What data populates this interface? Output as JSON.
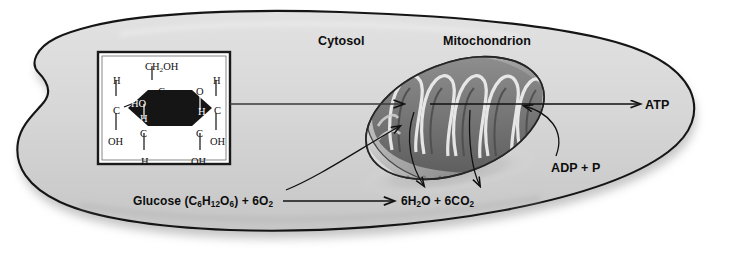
{
  "diagram": {
    "type": "biological-cell-diagram",
    "background_color": "#ffffff",
    "cytoplasm_color": "#d8d8d8",
    "outline_color": "#111111",
    "mitochondrion_color": "#9a9a9a"
  },
  "labels": {
    "cytosol": "Cytosol",
    "mitochondrion": "Mitochondrion",
    "atp": "ATP",
    "adp": "ADP + P"
  },
  "equation": {
    "reactants_prefix": "Glucose (C",
    "reactants_full": "Glucose (C6H12O6) + 6O2",
    "products_full": "6H2O + 6CO2",
    "reactants_parts": [
      {
        "text": "Glucose (C",
        "sub": false
      },
      {
        "text": "6",
        "sub": true
      },
      {
        "text": "H",
        "sub": false
      },
      {
        "text": "12",
        "sub": true
      },
      {
        "text": "O",
        "sub": false
      },
      {
        "text": "6",
        "sub": true
      },
      {
        "text": ") + 6O",
        "sub": false
      },
      {
        "text": "2",
        "sub": true
      }
    ],
    "products_parts": [
      {
        "text": "6H",
        "sub": false
      },
      {
        "text": "2",
        "sub": true
      },
      {
        "text": "O + 6CO",
        "sub": false
      },
      {
        "text": "2",
        "sub": true
      }
    ]
  },
  "glucose_inset": {
    "box_border_color": "#1a1a1a",
    "box_fill": "#ffffff",
    "ring_fill": "#151515",
    "atoms": [
      {
        "id": "ch2oh-top",
        "text": "CH2OH",
        "x": 145,
        "y": 61,
        "color": "dark"
      },
      {
        "id": "c-top-left",
        "text": "C",
        "x": 158,
        "y": 86,
        "color": "dark"
      },
      {
        "id": "h-upper-left",
        "text": "H",
        "x": 113,
        "y": 75,
        "color": "dark"
      },
      {
        "id": "c-left",
        "text": "C",
        "x": 113,
        "y": 105,
        "color": "dark"
      },
      {
        "id": "oh-lower-left",
        "text": "OH",
        "x": 108,
        "y": 136,
        "color": "dark"
      },
      {
        "id": "ho-inner",
        "text": "HO",
        "x": 131,
        "y": 98,
        "color": "white"
      },
      {
        "id": "h-inner",
        "text": "H",
        "x": 140,
        "y": 113,
        "color": "white"
      },
      {
        "id": "c-bottom-left",
        "text": "C",
        "x": 140,
        "y": 128,
        "color": "dark"
      },
      {
        "id": "h-bottom-left",
        "text": "H",
        "x": 141,
        "y": 156,
        "color": "dark"
      },
      {
        "id": "o-ring",
        "text": "O",
        "x": 196,
        "y": 86,
        "color": "dark"
      },
      {
        "id": "h-inner-right",
        "text": "H",
        "x": 198,
        "y": 106,
        "color": "white"
      },
      {
        "id": "h-upper-right",
        "text": "H",
        "x": 213,
        "y": 75,
        "color": "dark"
      },
      {
        "id": "c-right",
        "text": "C",
        "x": 214,
        "y": 105,
        "color": "dark"
      },
      {
        "id": "oh-lower-right",
        "text": "OH",
        "x": 210,
        "y": 136,
        "color": "dark"
      },
      {
        "id": "c-bottom-right",
        "text": "C",
        "x": 196,
        "y": 128,
        "color": "dark"
      },
      {
        "id": "oh-bottom",
        "text": "OH",
        "x": 191,
        "y": 156,
        "color": "dark"
      }
    ]
  },
  "arrows": {
    "glucose_to_mito": "curved arrow from glucose equation into mitochondrion",
    "inset_connector": "straight line from glucose box to mitochondrion",
    "atp_out": "arrow from mitochondrion to ATP",
    "adp_in": "curved arrow from ADP + P into mitochondrion",
    "products_out_1": "curved arrow from mitochondrion down to products",
    "products_out_2": "second curved arrow from mitochondrion down to products",
    "equation_arrow": "straight arrow from reactants to products"
  }
}
